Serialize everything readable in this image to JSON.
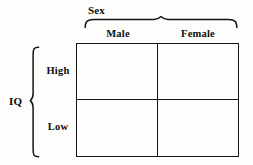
{
  "figure": {
    "type": "2x2-factorial-design-matrix",
    "background_color": "#fdfdfc",
    "line_color": "#151515",
    "text_color": "#0d0d0d"
  },
  "column_factor": {
    "name": "Sex",
    "brace": "top-curly-brace",
    "levels": [
      {
        "label": "Male"
      },
      {
        "label": "Female"
      }
    ]
  },
  "row_factor": {
    "name": "IQ",
    "brace": "left-curly-brace",
    "levels": [
      {
        "label": "High"
      },
      {
        "label": "Low"
      }
    ]
  },
  "matrix": {
    "rows": 2,
    "columns": 2,
    "cells": [
      [
        {
          "value": ""
        },
        {
          "value": ""
        }
      ],
      [
        {
          "value": ""
        },
        {
          "value": ""
        }
      ]
    ]
  }
}
